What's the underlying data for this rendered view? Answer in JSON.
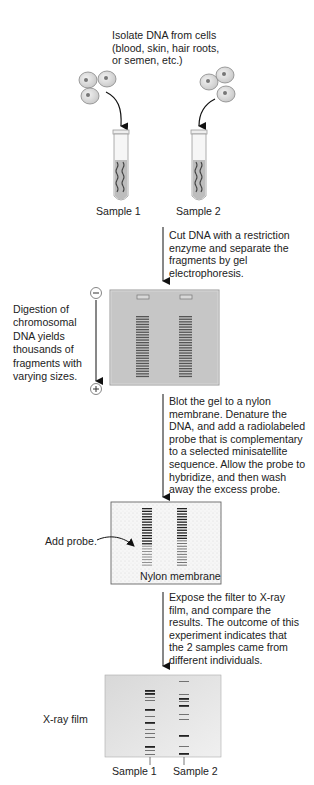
{
  "steps": {
    "isolate": "Isolate DNA from cells\n(blood, skin, hair roots,\nor semen, etc.)",
    "cut": "Cut DNA with a restriction\nenzyme and separate the\nfragments by gel\nelectrophoresis.",
    "digestion_note": "Digestion of\nchromosomal\nDNA yields\nthousands of\nfragments with\nvarying sizes.",
    "blot": "Blot the gel to a nylon\nmembrane. Denature the\nDNA, and add a radiolabeled\nprobe that is complementary\nto a selected minisatellite\nsequence. Allow the probe to\nhybridize, and then wash\naway the excess probe.",
    "expose": "Expose the filter to X-ray\nfilm, and compare the\nresults. The outcome of this\nexperiment indicates that\nthe 2 samples came from\ndifferent individuals."
  },
  "labels": {
    "sample1": "Sample 1",
    "sample2": "Sample 2",
    "film_sample1": "Sample 1",
    "film_sample2": "Sample 2",
    "add_probe": "Add probe.",
    "nylon_membrane": "Nylon membrane",
    "xray_film": "X-ray film",
    "minus": "−",
    "plus": "+"
  },
  "colors": {
    "gel": "#c8c8c8",
    "gel_border": "#9a9a9a",
    "band": "#444444",
    "membrane": "#f4f4f4",
    "film": "#e4e4e4"
  },
  "film_bands": {
    "sample1": [
      690,
      693,
      697,
      700,
      709,
      716,
      722,
      729,
      733,
      737,
      746,
      750,
      754
    ],
    "sample2": [
      681,
      694,
      698,
      701,
      705,
      714,
      719,
      735,
      746,
      753
    ]
  }
}
